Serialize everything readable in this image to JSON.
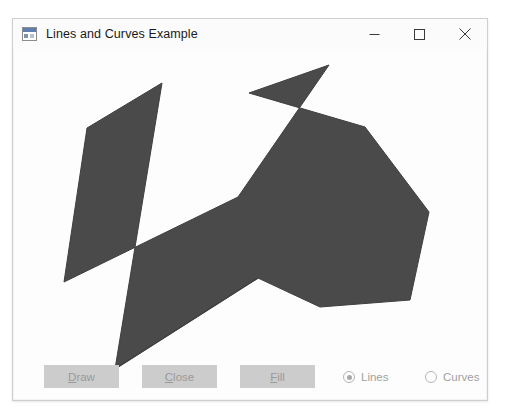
{
  "window": {
    "title": "Lines and Curves Example",
    "icon": "winforms-app-icon",
    "caption": {
      "minimize": "minimize-icon",
      "maximize": "maximize-icon",
      "close": "close-icon"
    }
  },
  "canvas": {
    "fill_color": "#4a4a4a",
    "stroke_color": "#3f3f3f",
    "background": "#fdfdfd",
    "polygon_points": "148,34 73,79 50,233 224,148 315,16 235,44 351,78 415,163 396,251 306,258 244,229 101,320",
    "line_points": "244,229 101,320"
  },
  "controls": {
    "buttons": [
      {
        "name": "draw",
        "mnemonic": "D",
        "rest": "raw",
        "enabled": false
      },
      {
        "name": "close",
        "mnemonic": "C",
        "rest": "lose",
        "enabled": false
      },
      {
        "name": "fill",
        "mnemonic": "F",
        "rest": "ill",
        "enabled": false
      }
    ],
    "radios": [
      {
        "name": "lines",
        "label": "Lines",
        "checked": true
      },
      {
        "name": "curves",
        "label": "Curves",
        "checked": false
      }
    ]
  }
}
